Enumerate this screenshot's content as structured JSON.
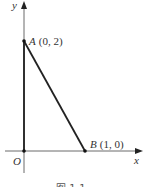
{
  "diagram": {
    "axes": {
      "x_label": "x",
      "y_label": "y",
      "origin_label": "O"
    },
    "points": [
      {
        "name": "A",
        "coords": "(0, 2)"
      },
      {
        "name": "B",
        "coords": "(1, 0)"
      }
    ],
    "segments": [
      "OA",
      "AB"
    ],
    "caption": "图 1-1",
    "colors": {
      "line": "#222222",
      "text": "#333333",
      "background": "#ffffff"
    }
  }
}
